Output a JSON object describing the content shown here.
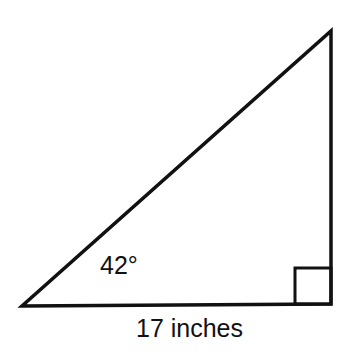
{
  "diagram": {
    "type": "right-triangle",
    "angle_label": "42°",
    "base_label": "17 inches",
    "stroke_color": "#111111",
    "background": "#ffffff"
  }
}
